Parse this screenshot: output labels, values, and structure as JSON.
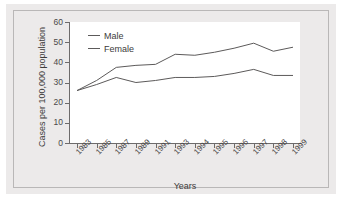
{
  "chart_data": {
    "type": "line",
    "title": "",
    "xlabel": "Years",
    "ylabel": "Cases per 100,000 population",
    "categories": [
      "1983",
      "1985",
      "1987",
      "1989",
      "1991",
      "1993",
      "1994",
      "1995",
      "1996",
      "1997",
      "1998",
      "1999"
    ],
    "series": [
      {
        "name": "Male",
        "values": [
          26,
          31,
          37.5,
          38.5,
          39,
          44,
          43.5,
          45,
          47,
          49.5,
          45.5,
          47.5
        ]
      },
      {
        "name": "Female",
        "values": [
          26,
          29,
          32.5,
          30,
          31,
          32.5,
          32.5,
          33,
          34.5,
          36.5,
          33.5,
          33.5
        ]
      }
    ],
    "ylim": [
      0,
      60
    ],
    "yticks": [
      "0",
      "10",
      "20",
      "30",
      "40",
      "50",
      "60"
    ],
    "grid": false,
    "legend_position": "upper-left",
    "line_color": "#5c5a5a",
    "panel_color": "#eceaea",
    "plot_background": "#ffffff"
  },
  "legend": {
    "entries": [
      {
        "label": "Male"
      },
      {
        "label": "Female"
      }
    ]
  }
}
